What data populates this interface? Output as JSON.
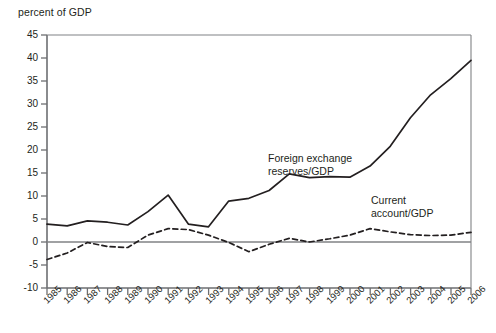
{
  "chart_data": {
    "type": "line",
    "title": "",
    "ylabel": "percent of GDP",
    "xlabel": "",
    "ylim": [
      -10,
      45
    ],
    "yticks": [
      45,
      40,
      35,
      30,
      25,
      20,
      15,
      10,
      5,
      0,
      -5,
      -10
    ],
    "grid": false,
    "zero_line": 0,
    "legend_position": "inline-annotations",
    "x": [
      1985,
      1986,
      1987,
      1988,
      1989,
      1990,
      1991,
      1992,
      1993,
      1994,
      1995,
      1996,
      1997,
      1998,
      1999,
      2000,
      2001,
      2002,
      2003,
      2004,
      2005,
      2006
    ],
    "categories": [
      "1985",
      "1986",
      "1987",
      "1988",
      "1989",
      "1990",
      "1991",
      "1992",
      "1993",
      "1994",
      "1995",
      "1996",
      "1997",
      "1998",
      "1999",
      "2000",
      "2001",
      "2002",
      "2003",
      "2004",
      "2005",
      "2006"
    ],
    "series": [
      {
        "name": "Foreign exchange reserves/GDP",
        "style": "solid",
        "color": "#231f20",
        "values": [
          3.9,
          3.5,
          4.6,
          4.3,
          3.7,
          6.6,
          10.2,
          3.9,
          3.3,
          8.9,
          9.5,
          11.2,
          14.8,
          14.0,
          14.2,
          14.1,
          16.5,
          20.8,
          27.0,
          32.0,
          35.5,
          39.5
        ]
      },
      {
        "name": "Current account/GDP",
        "style": "dashed",
        "color": "#231f20",
        "values": [
          -3.8,
          -2.4,
          -0.1,
          -1.0,
          -1.2,
          1.5,
          2.9,
          2.7,
          1.5,
          -0.1,
          -2.1,
          -0.5,
          0.8,
          0.0,
          0.7,
          1.5,
          2.9,
          2.2,
          1.6,
          1.4,
          1.5,
          2.1
        ]
      }
    ],
    "annotations": [
      {
        "name": "reserves-label",
        "text_line1": "Foreign exchange",
        "text_line2": "reserves/GDP"
      },
      {
        "name": "current-account-label",
        "text_line1": "Current",
        "text_line2": "account/GDP"
      }
    ]
  },
  "labels": {
    "reserves_line1": "Foreign exchange",
    "reserves_line2": "reserves/GDP",
    "current_line1": "Current",
    "current_line2": "account/GDP"
  }
}
